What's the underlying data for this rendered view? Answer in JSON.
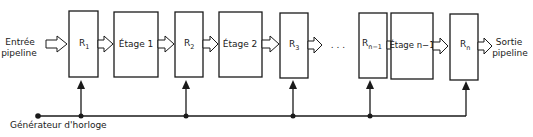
{
  "diagram": {
    "type": "pipeline-block-diagram",
    "input_label_line1": "Entrée",
    "input_label_line2": "pipeline",
    "output_label_line1": "Sortie",
    "output_label_line2": "pipeline",
    "clock_label": "Générateur d'horloge",
    "ellipsis": ". . .",
    "registers": [
      {
        "base": "R",
        "sub": "1"
      },
      {
        "base": "R",
        "sub": "2"
      },
      {
        "base": "R",
        "sub": "3"
      },
      {
        "base": "R",
        "sub": "n−1"
      },
      {
        "base": "R",
        "sub": "n"
      }
    ],
    "stages": [
      {
        "label": "Étage 1"
      },
      {
        "label": "Étage 2"
      },
      {
        "label": "Étage n−1"
      }
    ],
    "colors": {
      "stroke": "#1a1a1a",
      "background": "#ffffff"
    }
  }
}
